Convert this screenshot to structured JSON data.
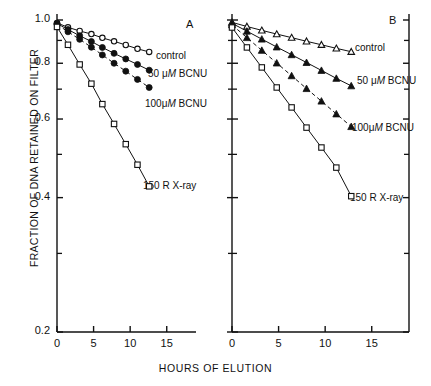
{
  "figure": {
    "xlabel": "HOURS OF ELUTION",
    "ylabel": "FRACTION OF DNA RETAINED ON FILTER",
    "panel_a_letter": "A",
    "panel_b_letter": "B"
  },
  "axes": {
    "y_ticks": [
      "1.0",
      "0.8",
      "0.6",
      "0.4",
      "0.2"
    ],
    "y_tick_values": [
      1.0,
      0.8,
      0.6,
      0.4,
      0.2
    ],
    "y_minor_values": [
      0.9,
      0.7,
      0.5,
      0.3
    ],
    "x_ticks": [
      "0",
      "5",
      "10",
      "15"
    ],
    "x_tick_values": [
      0,
      5,
      10,
      15
    ],
    "xlim": [
      0,
      19
    ],
    "ylim": [
      0.2,
      1.0
    ],
    "yscale": "log",
    "grid": "off"
  },
  "labels": {
    "control": "control",
    "bcnu50_pre": "50 ",
    "bcnu50_mu": "μ",
    "bcnu50_M": "M",
    "bcnu50_post": " BCNU",
    "bcnu100_pre": "100",
    "bcnu100_mu": "μ",
    "bcnu100_M": "M",
    "bcnu100_post": " BCNU",
    "xray": "150 R X-ray",
    "bcnu50_full": "50 μM BCNU",
    "bcnu100_full": "100 μM BCNU"
  },
  "colors": {
    "ink": "#111111",
    "axis": "#111111",
    "marker_fill_open": "#ffffff",
    "marker_fill_closed": "#111111"
  },
  "chart_data": {
    "type": "line",
    "title": "",
    "xlabel": "HOURS OF ELUTION",
    "ylabel": "FRACTION OF DNA RETAINED ON FILTER",
    "xlim": [
      0,
      19
    ],
    "ylim": [
      0.2,
      1.0
    ],
    "yscale": "log",
    "grid": "off",
    "legend_position": "inline-right-of-curve",
    "panels": [
      {
        "panel": "A",
        "label": "A",
        "series": [
          {
            "name": "control",
            "marker": "open-circle",
            "linestyle": "solid",
            "x": [
              0,
              1.5,
              3.1,
              4.7,
              6.2,
              7.8,
              9.4,
              11.0,
              12.6
            ],
            "y": [
              0.985,
              0.963,
              0.945,
              0.93,
              0.912,
              0.896,
              0.879,
              0.862,
              0.848
            ]
          },
          {
            "name": "50 μM BCNU",
            "marker": "filled-circle",
            "linestyle": "solid",
            "x": [
              0,
              1.5,
              3.1,
              4.7,
              6.2,
              7.8,
              9.4,
              11.0,
              12.6
            ],
            "y": [
              0.982,
              0.952,
              0.922,
              0.895,
              0.868,
              0.842,
              0.818,
              0.795,
              0.772
            ]
          },
          {
            "name": "100 μM BCNU",
            "marker": "filled-circle",
            "linestyle": "dashed",
            "x": [
              0,
              1.5,
              3.1,
              4.7,
              6.2,
              7.8,
              9.4,
              11.0,
              12.6
            ],
            "y": [
              0.978,
              0.941,
              0.905,
              0.869,
              0.835,
              0.8,
              0.768,
              0.736,
              0.706
            ]
          },
          {
            "name": "150 R X-ray",
            "marker": "open-square",
            "linestyle": "solid",
            "x": [
              0,
              1.5,
              3.1,
              4.7,
              6.2,
              7.8,
              9.4,
              11.0,
              12.6
            ],
            "y": [
              0.965,
              0.88,
              0.795,
              0.72,
              0.648,
              0.585,
              0.527,
              0.474,
              0.424
            ]
          }
        ]
      },
      {
        "panel": "B",
        "label": "B",
        "series": [
          {
            "name": "control",
            "marker": "open-triangle",
            "linestyle": "solid",
            "x": [
              0,
              1.6,
              3.2,
              4.8,
              6.4,
              8.0,
              9.6,
              11.2,
              12.8
            ],
            "y": [
              0.988,
              0.967,
              0.948,
              0.93,
              0.913,
              0.896,
              0.88,
              0.864,
              0.849
            ]
          },
          {
            "name": "50 μM BCNU",
            "marker": "filled-triangle",
            "linestyle": "solid",
            "x": [
              0,
              1.6,
              3.2,
              4.8,
              6.4,
              8.0,
              9.6,
              11.2,
              12.8
            ],
            "y": [
              0.983,
              0.944,
              0.906,
              0.87,
              0.836,
              0.803,
              0.771,
              0.74,
              0.712
            ]
          },
          {
            "name": "100 μM BCNU",
            "marker": "filled-triangle",
            "linestyle": "dashed",
            "x": [
              0,
              1.6,
              3.2,
              4.8,
              6.4,
              8.0,
              9.6,
              11.2,
              12.8
            ],
            "y": [
              0.975,
              0.913,
              0.855,
              0.801,
              0.75,
              0.702,
              0.658,
              0.616,
              0.577
            ]
          },
          {
            "name": "150 R X-ray",
            "marker": "open-square",
            "linestyle": "solid",
            "x": [
              0,
              1.6,
              3.2,
              4.8,
              6.4,
              8.0,
              9.6,
              11.2,
              12.8
            ],
            "y": [
              0.962,
              0.868,
              0.783,
              0.706,
              0.637,
              0.574,
              0.518,
              0.467,
              0.403
            ]
          }
        ]
      }
    ]
  }
}
